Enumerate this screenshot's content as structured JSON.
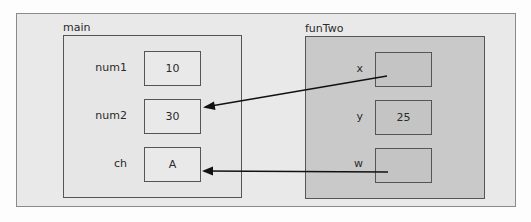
{
  "diagram": {
    "frames": [
      {
        "name": "main",
        "variables": [
          {
            "label": "num1",
            "value": "10"
          },
          {
            "label": "num2",
            "value": "30"
          },
          {
            "label": "ch",
            "value": "A"
          }
        ]
      },
      {
        "name": "funTwo",
        "variables": [
          {
            "label": "x",
            "value": ""
          },
          {
            "label": "y",
            "value": "25"
          },
          {
            "label": "w",
            "value": ""
          }
        ]
      }
    ],
    "references": [
      {
        "from": "funTwo.x",
        "to": "main.num2"
      },
      {
        "from": "funTwo.w",
        "to": "main.ch"
      }
    ],
    "colors": {
      "background": "#e9e9e9",
      "main_frame": "#e6e6e6",
      "funTwo_frame": "#c9c9c9",
      "border": "#555555",
      "arrow": "#111111"
    }
  }
}
